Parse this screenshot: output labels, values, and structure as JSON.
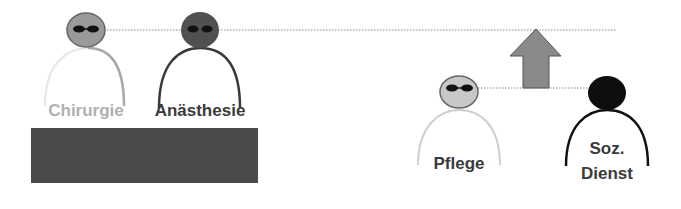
{
  "figures": [
    {
      "id": "chirurgie",
      "label": "Chirurgie",
      "head_color": "#9a9a9a",
      "body_color": "#bcbcbc",
      "text_color": "#b0b0b0",
      "glasses": true
    },
    {
      "id": "anaesthesie",
      "label": "Anästhesie",
      "head_color": "#505050",
      "body_color": "#3a3a3a",
      "text_color": "#3a3a3a",
      "glasses": true
    },
    {
      "id": "pflege",
      "label": "Pflege",
      "head_color": "#c8c8c8",
      "body_color": "#cfcfcf",
      "text_color": "#3a3a3a",
      "glasses": true
    },
    {
      "id": "soz-dienst",
      "label_line1": "Soz.",
      "label_line2": "Dienst",
      "head_color": "#0e0e0e",
      "body_color": "#111111",
      "text_color": "#3a3a3a",
      "glasses": false
    }
  ],
  "base_block": {
    "color": "#4a4a4a"
  },
  "arrow": {
    "direction": "up",
    "fill": "#8a8a8a",
    "stroke": "#555555"
  },
  "lines": {
    "style": "dotted",
    "color": "#888888"
  }
}
